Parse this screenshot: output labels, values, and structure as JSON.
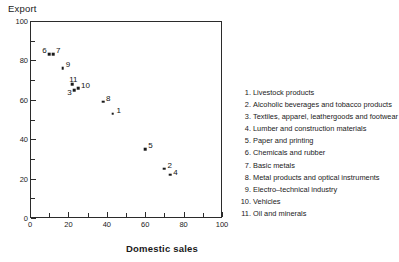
{
  "chart_data": {
    "type": "scatter",
    "title": "",
    "xlabel": "Domestic sales",
    "ylabel": "Export",
    "xlim": [
      0,
      100
    ],
    "ylim": [
      0,
      100
    ],
    "grid": false,
    "legend_position": "right",
    "x_ticks": [
      0,
      20,
      40,
      60,
      80,
      100
    ],
    "x_tick_labels": [
      "0",
      "20",
      "40",
      "60",
      "80",
      "100"
    ],
    "x_minor_ticks": [
      10,
      30,
      50,
      70,
      90
    ],
    "y_ticks": [
      0,
      20,
      40,
      60,
      80,
      100
    ],
    "y_tick_labels": [
      "0",
      "20",
      "40",
      "60",
      "80",
      "100"
    ],
    "y_minor_ticks": [
      10,
      30,
      50,
      70,
      90
    ],
    "points": [
      {
        "label": "1",
        "x": 43,
        "y": 53,
        "label_dx": 4,
        "label_dy": -8
      },
      {
        "label": "2",
        "x": 70,
        "y": 25,
        "label_dx": 3,
        "label_dy": -8
      },
      {
        "label": "3",
        "x": 23,
        "y": 65,
        "label_dx": -7,
        "label_dy": -2
      },
      {
        "label": "4",
        "x": 73,
        "y": 22,
        "label_dx": 3,
        "label_dy": -7
      },
      {
        "label": "5",
        "x": 60,
        "y": 35,
        "label_dx": 3,
        "label_dy": -8
      },
      {
        "label": "6",
        "x": 10,
        "y": 83,
        "label_dx": -7,
        "label_dy": -8
      },
      {
        "label": "7",
        "x": 12,
        "y": 83,
        "label_dx": 3,
        "label_dy": -8
      },
      {
        "label": "9",
        "x": 17,
        "y": 76,
        "label_dx": 3,
        "label_dy": -8
      },
      {
        "label": "11",
        "x": 22,
        "y": 68,
        "label_dx": -3,
        "label_dy": -9
      },
      {
        "label": "10",
        "x": 25,
        "y": 66,
        "label_dx": 3,
        "label_dy": -7
      },
      {
        "label": "8",
        "x": 38,
        "y": 59,
        "label_dx": 3,
        "label_dy": -8
      }
    ],
    "legend_entries": [
      {
        "num": "1.",
        "text": "Livestock products"
      },
      {
        "num": "2.",
        "text": "Alcoholic beverages and tobacco products"
      },
      {
        "num": "3.",
        "text": "Textiles, apparel, leathergoods and footwear"
      },
      {
        "num": "4.",
        "text": "Lumber and construction materials"
      },
      {
        "num": "5.",
        "text": "Paper and printing"
      },
      {
        "num": "6.",
        "text": "Chemicals and rubber"
      },
      {
        "num": "7.",
        "text": "Basic metals"
      },
      {
        "num": "8.",
        "text": "Metal products and optical instruments"
      },
      {
        "num": "9.",
        "text": "Electro–technical industry"
      },
      {
        "num": "10.",
        "text": "Vehicles"
      },
      {
        "num": "11.",
        "text": "Oil and minerals"
      }
    ]
  }
}
